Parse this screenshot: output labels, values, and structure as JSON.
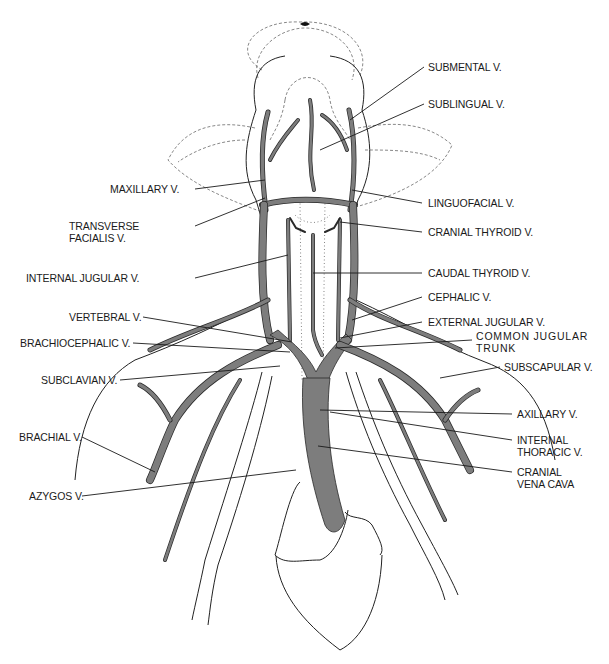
{
  "diagram": {
    "vein_color": "#7d7d7d",
    "line_color": "#1a1a1a",
    "labels": {
      "submental": "SUBMENTAL V.",
      "sublingual": "SUBLINGUAL V.",
      "maxillary": "MAXILLARY V.",
      "linguofacial": "LINGUOFACIAL V.",
      "transverse_facialis_1": "TRANSVERSE",
      "transverse_facialis_2": "FACIALIS V.",
      "cranial_thyroid": "CRANIAL THYROID V.",
      "internal_jugular": "INTERNAL JUGULAR V.",
      "caudal_thyroid": "CAUDAL THYROID V.",
      "cephalic": "CEPHALIC V.",
      "vertebral": "VERTEBRAL V.",
      "external_jugular": "EXTERNAL JUGULAR V.",
      "common_jugular_1": "COMMON JUGULAR",
      "common_jugular_2": "TRUNK",
      "brachiocephalic": "BRACHIOCEPHALIC V.",
      "subclavian": "SUBCLAVIAN V.",
      "subscapular": "SUBSCAPULAR V.",
      "axillary": "AXILLARY V.",
      "brachial": "BRACHIAL V.",
      "internal_thoracic_1": "INTERNAL",
      "internal_thoracic_2": "THORACIC V.",
      "azygos": "AZYGOS V.",
      "cranial_vena_cava_1": "CRANIAL",
      "cranial_vena_cava_2": "VENA CAVA"
    }
  }
}
